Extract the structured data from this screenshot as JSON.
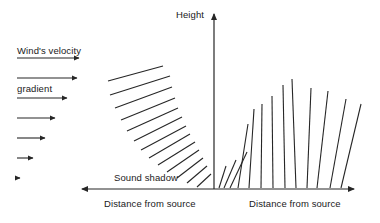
{
  "figure": {
    "title_text": "Wind's velocity gradient",
    "labels": {
      "wind_gradient_line1": "Wind's velocity",
      "wind_gradient_line2": "gradient",
      "height_axis": "Height",
      "sound_shadow": "Sound shadow",
      "distance_left": "Distance from source",
      "distance_right": "Distance from source"
    },
    "colors": {
      "stroke": "#262626",
      "text": "#1a1a1a",
      "background": "#ffffff"
    },
    "axes": {
      "vertical": {
        "x": 214,
        "y_top": 12,
        "y_bottom": 189,
        "arrow": "up"
      },
      "horizontal_left": {
        "y": 189,
        "x_start": 214,
        "x_end": 80,
        "arrow": "left"
      },
      "horizontal_right": {
        "y": 189,
        "x_start": 214,
        "x_end": 356,
        "arrow": "right"
      }
    },
    "wind_arrows": [
      {
        "x1": 17,
        "y": 58,
        "x2": 84
      },
      {
        "x1": 17,
        "y": 78,
        "x2": 82
      },
      {
        "x1": 17,
        "y": 98,
        "x2": 72
      },
      {
        "x1": 17,
        "y": 118,
        "x2": 60
      },
      {
        "x1": 17,
        "y": 138,
        "x2": 50
      },
      {
        "x1": 17,
        "y": 158,
        "x2": 38
      },
      {
        "x1": 17,
        "y": 178,
        "x2": 25
      }
    ],
    "left_rays": [
      {
        "x1": 108,
        "y1": 81,
        "x2": 163,
        "y2": 66
      },
      {
        "x1": 110,
        "y1": 95,
        "x2": 170,
        "y2": 76
      },
      {
        "x1": 115,
        "y1": 108,
        "x2": 172,
        "y2": 87
      },
      {
        "x1": 121,
        "y1": 120,
        "x2": 175,
        "y2": 98
      },
      {
        "x1": 127,
        "y1": 131,
        "x2": 178,
        "y2": 108
      },
      {
        "x1": 134,
        "y1": 141,
        "x2": 182,
        "y2": 117
      },
      {
        "x1": 141,
        "y1": 150,
        "x2": 186,
        "y2": 126
      },
      {
        "x1": 149,
        "y1": 158,
        "x2": 190,
        "y2": 134
      },
      {
        "x1": 158,
        "y1": 165,
        "x2": 195,
        "y2": 142
      },
      {
        "x1": 167,
        "y1": 172,
        "x2": 199,
        "y2": 150
      },
      {
        "x1": 177,
        "y1": 178,
        "x2": 203,
        "y2": 158
      },
      {
        "x1": 187,
        "y1": 183,
        "x2": 207,
        "y2": 166
      },
      {
        "x1": 197,
        "y1": 187,
        "x2": 211,
        "y2": 174
      }
    ],
    "right_rays": [
      {
        "x1": 219,
        "y1": 188,
        "x2": 226,
        "y2": 166
      },
      {
        "x1": 224,
        "y1": 188,
        "x2": 236,
        "y2": 160
      },
      {
        "x1": 230,
        "y1": 188,
        "x2": 247,
        "y2": 152
      },
      {
        "x1": 238,
        "y1": 188,
        "x2": 248,
        "y2": 124
      },
      {
        "x1": 249,
        "y1": 188,
        "x2": 254,
        "y2": 109
      },
      {
        "x1": 261,
        "y1": 188,
        "x2": 262,
        "y2": 104
      },
      {
        "x1": 273,
        "y1": 188,
        "x2": 272,
        "y2": 96
      },
      {
        "x1": 285,
        "y1": 188,
        "x2": 283,
        "y2": 85
      },
      {
        "x1": 296,
        "y1": 188,
        "x2": 292,
        "y2": 79
      },
      {
        "x1": 307,
        "y1": 188,
        "x2": 311,
        "y2": 88
      },
      {
        "x1": 317,
        "y1": 188,
        "x2": 328,
        "y2": 91
      },
      {
        "x1": 330,
        "y1": 188,
        "x2": 346,
        "y2": 99
      },
      {
        "x1": 341,
        "y1": 188,
        "x2": 361,
        "y2": 104
      }
    ]
  }
}
